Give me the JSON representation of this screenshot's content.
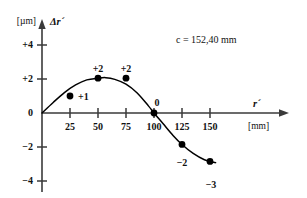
{
  "chart_data": {
    "type": "scatter",
    "title": "",
    "subtitle": "",
    "annotation": "c = 152,40 mm",
    "xlabel": "r´",
    "xunit": "[mm]",
    "ylabel": "Δr´",
    "yunit": "[µm]",
    "grid": false,
    "legend": "none",
    "xlim": [
      0,
      160
    ],
    "ylim": [
      -4.6,
      4.6
    ],
    "xticks": [
      25,
      50,
      75,
      100,
      125,
      150
    ],
    "xticklabels": [
      "25",
      "50",
      "75",
      "100",
      "125",
      "150"
    ],
    "yticks": [
      4,
      2,
      0,
      -2,
      -4
    ],
    "yticklabels": [
      "+4",
      "+2",
      "0",
      "−2",
      "−4"
    ],
    "x": [
      25,
      50,
      75,
      100,
      125,
      150
    ],
    "values": [
      1.0,
      2.05,
      2.05,
      0.0,
      -1.85,
      -2.85
    ],
    "point_labels": [
      "+1",
      "+2",
      "+2",
      "0",
      "−2",
      "−3"
    ],
    "series": [
      {
        "name": "Δr´ measured",
        "x": [
          25,
          50,
          75,
          100,
          125,
          150
        ],
        "values": [
          1.0,
          2.05,
          2.05,
          0.0,
          -1.85,
          -2.85
        ]
      }
    ],
    "curve": {
      "name": "fitted curve",
      "x": [
        0,
        10,
        20,
        30,
        40,
        50,
        57,
        65,
        75,
        85,
        95,
        100,
        108,
        117,
        125,
        135,
        145,
        155
      ],
      "y": [
        0.0,
        0.62,
        1.2,
        1.65,
        1.95,
        2.05,
        2.08,
        1.98,
        1.7,
        1.18,
        0.42,
        0.0,
        -0.62,
        -1.32,
        -1.85,
        -2.38,
        -2.75,
        -2.92
      ]
    },
    "colors": {
      "axis": "#333333",
      "curve": "#000000",
      "marker": "#000000",
      "background": "#ffffff",
      "text": "#111111"
    }
  }
}
